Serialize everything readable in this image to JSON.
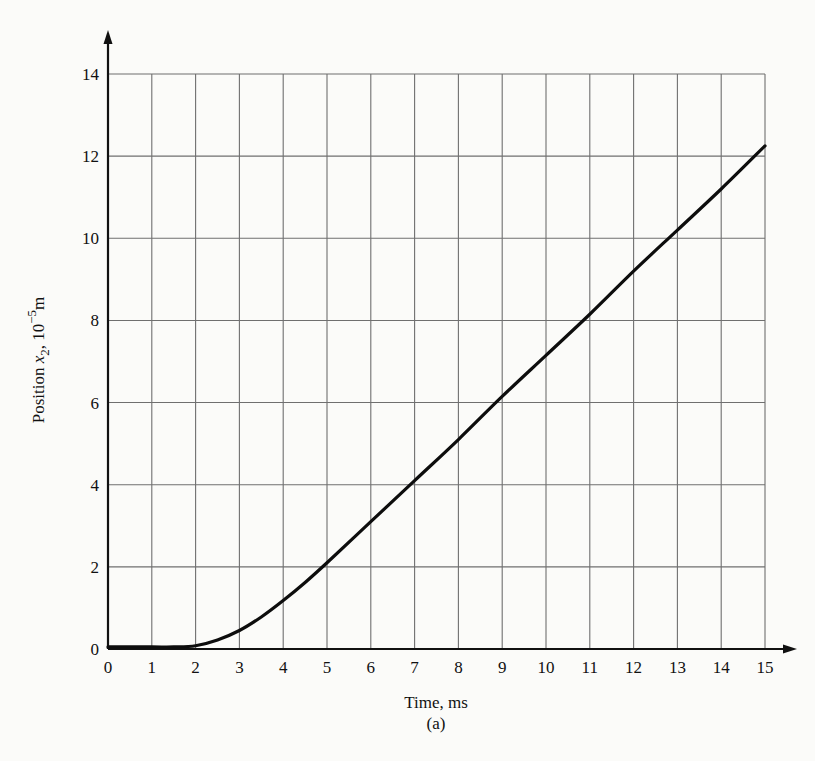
{
  "chart_data": {
    "type": "line",
    "title": "",
    "subtitle": "(a)",
    "xlabel": "Time, ms",
    "ylabel": "Position x2, 10^-5 m",
    "ylabel_parts": {
      "main": "Position ",
      "var": "x",
      "sub": "2",
      "mid": ", 10",
      "sup": "−5",
      "unit": "m"
    },
    "xlim": [
      0,
      15
    ],
    "ylim": [
      0,
      14
    ],
    "x_ticks": [
      0,
      1,
      2,
      3,
      4,
      5,
      6,
      7,
      8,
      9,
      10,
      11,
      12,
      13,
      14,
      15
    ],
    "y_ticks": [
      0,
      2,
      4,
      6,
      8,
      10,
      12,
      14
    ],
    "grid": true,
    "legend": null,
    "series": [
      {
        "name": "x2",
        "x": [
          0,
          1,
          1.5,
          2,
          2.5,
          3,
          3.5,
          4,
          4.5,
          5,
          6,
          7,
          8,
          9,
          10,
          11,
          12,
          13,
          14,
          15
        ],
        "values": [
          0.05,
          0.05,
          0.05,
          0.08,
          0.22,
          0.45,
          0.78,
          1.18,
          1.62,
          2.1,
          3.1,
          4.1,
          5.1,
          6.15,
          7.15,
          8.15,
          9.2,
          10.2,
          11.2,
          12.25
        ]
      }
    ]
  }
}
